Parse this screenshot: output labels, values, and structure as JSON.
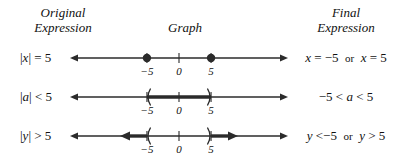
{
  "headers": {
    "original": "Original\nExpression",
    "original_line1": "Original",
    "original_line2": "Expression",
    "graph": "Graph",
    "final_line1": "Final",
    "final_line2": "Expression"
  },
  "rows": [
    {
      "original_expression": "|x| = 5",
      "original_parts": {
        "bar_open": "|",
        "variable": "x",
        "bar_close": "|",
        "relation": "= 5"
      },
      "final_expression": "x = −5   or   x = 5",
      "final_parts": {
        "left": "x",
        "left_rel": "= −5",
        "conjunction": "or",
        "right": "x",
        "right_rel": "= 5"
      },
      "graph": {
        "type": "points",
        "tick_labels": [
          "−5",
          "0",
          "5"
        ],
        "tick_values": [
          -5,
          0,
          5
        ],
        "endpoints": [
          {
            "value": -5,
            "style": "closed-dot"
          },
          {
            "value": 5,
            "style": "closed-dot"
          }
        ],
        "shaded": []
      }
    },
    {
      "original_expression": "|a| < 5",
      "original_parts": {
        "bar_open": "|",
        "variable": "a",
        "bar_close": "|",
        "relation": "< 5"
      },
      "final_expression": "−5 < a < 5",
      "final_parts": {
        "low": "−5",
        "rel_low": "<",
        "variable": "a",
        "rel_high": "<",
        "high": "5"
      },
      "graph": {
        "type": "segment",
        "tick_labels": [
          "−5",
          "0",
          "5"
        ],
        "tick_values": [
          -5,
          0,
          5
        ],
        "endpoints": [
          {
            "value": -5,
            "style": "open-paren-left"
          },
          {
            "value": 5,
            "style": "open-paren-right"
          }
        ],
        "shaded": [
          {
            "from": -5,
            "to": 5,
            "arrow_left": false,
            "arrow_right": false
          }
        ]
      }
    },
    {
      "original_expression": "|y| > 5",
      "original_parts": {
        "bar_open": "|",
        "variable": "y",
        "bar_close": "|",
        "relation": "> 5"
      },
      "final_expression": "y < −5   or   y > 5",
      "final_parts": {
        "left": "y",
        "left_rel": "<−5",
        "conjunction": "or",
        "right": "y",
        "right_rel": "> 5"
      },
      "graph": {
        "type": "two-rays",
        "tick_labels": [
          "−5",
          "0",
          "5"
        ],
        "tick_values": [
          -5,
          0,
          5
        ],
        "endpoints": [
          {
            "value": -5,
            "style": "open-paren-left"
          },
          {
            "value": 5,
            "style": "open-paren-right"
          }
        ],
        "shaded": [
          {
            "from": -9.2,
            "to": -5,
            "arrow_left": true,
            "arrow_right": false
          },
          {
            "from": 5,
            "to": 9.2,
            "arrow_left": false,
            "arrow_right": true
          }
        ]
      }
    }
  ],
  "colors": {
    "ink": "#1a1a1a",
    "line": "#2b2b2b",
    "background": "#ffffff"
  },
  "axis": {
    "min": -17,
    "max": 17,
    "pixel_left": 4,
    "pixel_right": 222
  }
}
